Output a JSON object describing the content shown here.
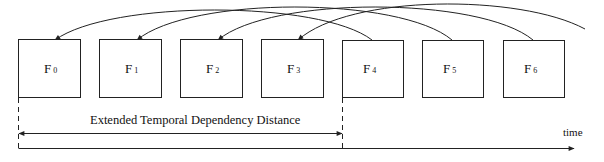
{
  "diagram": {
    "frames": [
      {
        "letter": "F",
        "index": "0"
      },
      {
        "letter": "F",
        "index": "1"
      },
      {
        "letter": "F",
        "index": "2"
      },
      {
        "letter": "F",
        "index": "3"
      },
      {
        "letter": "F",
        "index": "4"
      },
      {
        "letter": "F",
        "index": "5"
      },
      {
        "letter": "F",
        "index": "6"
      }
    ],
    "dependencies": [
      {
        "from": "F4",
        "to": "F0"
      },
      {
        "from": "F5",
        "to": "F1"
      },
      {
        "from": "F6",
        "to": "F2"
      },
      {
        "from": "F7 (off-screen)",
        "to": "F3"
      }
    ],
    "distance_label": "Extended Temporal Dependency Distance",
    "axis_label": "time"
  }
}
